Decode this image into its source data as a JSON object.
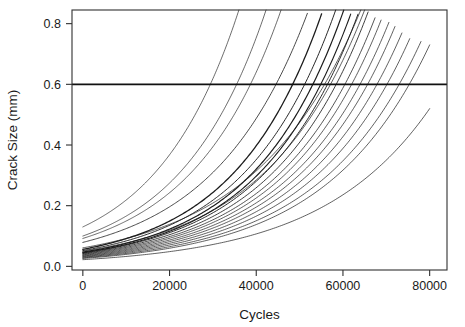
{
  "figure": {
    "name": "crack-growth-plot",
    "width": 465,
    "height": 327,
    "background": "#ffffff",
    "foreground": "#1a1a1a"
  },
  "chart_data": {
    "type": "line",
    "title": "",
    "xlabel": "Cycles",
    "ylabel": "Crack Size (mm)",
    "xlim": [
      -2500,
      84000
    ],
    "ylim": [
      -0.012,
      0.845
    ],
    "xticks": [
      0,
      20000,
      40000,
      60000,
      80000
    ],
    "xticklabels": [
      "0",
      "20000",
      "40000",
      "60000",
      "80000"
    ],
    "yticks": [
      0.0,
      0.2,
      0.4,
      0.6,
      0.8
    ],
    "yticklabels": [
      "0.0",
      "0.2",
      "0.4",
      "0.6",
      "0.8"
    ],
    "grid": false,
    "legend": null,
    "box": true,
    "line_color": "#1c1c1c",
    "annotations": [
      {
        "name": "critical-crack-size-threshold",
        "type": "hline",
        "y": 0.6,
        "label": "",
        "color": "#111111",
        "linewidth": 1.9
      }
    ],
    "series_note": "21 fatigue crack-growth trajectories; crack size grows exponentially with load cycles; curves terminate where they exit the 0.845 mm top of the panel or at 80000 cycles.",
    "series": [
      {
        "name": "unit-01",
        "a0": 0.13,
        "rate": 5.2e-05,
        "x_end": 39000,
        "weight": 0.65
      },
      {
        "name": "unit-02",
        "a0": 0.1,
        "rate": 5.05e-05,
        "x_end": 46200,
        "weight": 0.65
      },
      {
        "name": "unit-03",
        "a0": 0.092,
        "rate": 4.85e-05,
        "x_end": 49500,
        "weight": 0.65
      },
      {
        "name": "unit-04",
        "a0": 0.079,
        "rate": 4.55e-05,
        "x_end": 55800,
        "weight": 0.8
      },
      {
        "name": "unit-05",
        "a0": 0.056,
        "rate": 4.9e-05,
        "x_end": 57500,
        "weight": 1.3
      },
      {
        "name": "unit-06",
        "a0": 0.052,
        "rate": 4.78e-05,
        "x_end": 60200,
        "weight": 0.95
      },
      {
        "name": "unit-07",
        "a0": 0.047,
        "rate": 4.8e-05,
        "x_end": 61500,
        "weight": 1.2
      },
      {
        "name": "unit-08",
        "a0": 0.045,
        "rate": 4.72e-05,
        "x_end": 63000,
        "weight": 1.1
      },
      {
        "name": "unit-09",
        "a0": 0.044,
        "rate": 4.63e-05,
        "x_end": 64400,
        "weight": 0.95
      },
      {
        "name": "unit-10",
        "a0": 0.042,
        "rate": 4.55e-05,
        "x_end": 65800,
        "weight": 0.85
      },
      {
        "name": "unit-11",
        "a0": 0.05,
        "rate": 4.35e-05,
        "x_end": 66500,
        "weight": 0.7
      },
      {
        "name": "unit-12",
        "a0": 0.04,
        "rate": 4.48e-05,
        "x_end": 67400,
        "weight": 0.75
      },
      {
        "name": "unit-13",
        "a0": 0.038,
        "rate": 4.45e-05,
        "x_end": 68800,
        "weight": 0.7
      },
      {
        "name": "unit-14",
        "a0": 0.061,
        "rate": 4.1e-05,
        "x_end": 69200,
        "weight": 0.7
      },
      {
        "name": "unit-15",
        "a0": 0.036,
        "rate": 4.4e-05,
        "x_end": 70600,
        "weight": 0.7
      },
      {
        "name": "unit-16",
        "a0": 0.034,
        "rate": 4.37e-05,
        "x_end": 72000,
        "weight": 0.7
      },
      {
        "name": "unit-17",
        "a0": 0.032,
        "rate": 4.32e-05,
        "x_end": 73600,
        "weight": 0.7
      },
      {
        "name": "unit-18",
        "a0": 0.03,
        "rate": 4.27e-05,
        "x_end": 75400,
        "weight": 0.7
      },
      {
        "name": "unit-19",
        "a0": 0.028,
        "rate": 4.2e-05,
        "x_end": 78000,
        "weight": 0.7
      },
      {
        "name": "unit-20",
        "a0": 0.026,
        "rate": 4.1e-05,
        "x_end": 80000,
        "y_end": 0.73,
        "weight": 0.7
      },
      {
        "name": "unit-21",
        "a0": 0.022,
        "rate": 3.95e-05,
        "x_end": 80000,
        "y_end": 0.52,
        "weight": 0.7
      }
    ]
  }
}
